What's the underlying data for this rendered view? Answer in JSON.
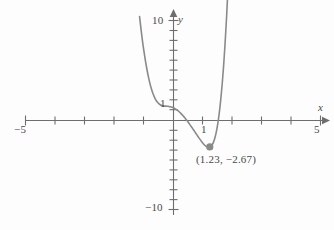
{
  "chart_data": {
    "type": "line",
    "title": "",
    "xlabel": "x",
    "ylabel": "y",
    "xlim": [
      -5,
      5
    ],
    "ylim": [
      -10,
      10
    ],
    "grid": false,
    "legend": null,
    "x_ticks": [
      -5,
      -4,
      -3,
      -2,
      -1,
      0,
      1,
      2,
      3,
      4,
      5
    ],
    "y_ticks": [
      -10,
      -9,
      -8,
      -7,
      -6,
      -5,
      -4,
      -3,
      -2,
      -1,
      0,
      1,
      2,
      3,
      4,
      5,
      6,
      7,
      8,
      9,
      10
    ],
    "x_tick_labels_shown": [
      "-5",
      "1",
      "5"
    ],
    "y_tick_labels_shown": [
      "10",
      "1",
      "-10"
    ],
    "series": [
      {
        "name": "curve",
        "color": "#8a8a8a",
        "x": [
          -1.15,
          -1.1,
          -1.05,
          -1.0,
          -0.95,
          -0.9,
          -0.85,
          -0.8,
          -0.75,
          -0.7,
          -0.65,
          -0.6,
          -0.55,
          -0.5,
          -0.45,
          -0.4,
          -0.35,
          -0.3,
          -0.25,
          -0.2,
          -0.15,
          -0.1,
          -0.05,
          0.0,
          0.05,
          0.1,
          0.15,
          0.2,
          0.25,
          0.3,
          0.35,
          0.4,
          0.45,
          0.5,
          0.55,
          0.6,
          0.65,
          0.7,
          0.75,
          0.8,
          0.85,
          0.9,
          0.95,
          1.0,
          1.05,
          1.1,
          1.15,
          1.2,
          1.23,
          1.25,
          1.3,
          1.35,
          1.4,
          1.45,
          1.5,
          1.55,
          1.6,
          1.65,
          1.7,
          1.75,
          1.8,
          1.85
        ],
        "y": [
          10.5,
          9.2,
          8.0,
          6.95,
          6.0,
          5.15,
          4.4,
          3.75,
          3.2,
          2.75,
          2.38,
          2.08,
          1.86,
          1.7,
          1.59,
          1.52,
          1.48,
          1.46,
          1.45,
          1.44,
          1.42,
          1.39,
          1.34,
          1.28,
          1.2,
          1.1,
          0.99,
          0.86,
          0.72,
          0.56,
          0.39,
          0.21,
          0.02,
          -0.18,
          -0.39,
          -0.6,
          -0.82,
          -1.04,
          -1.26,
          -1.48,
          -1.7,
          -1.91,
          -2.11,
          -2.3,
          -2.47,
          -2.6,
          -2.66,
          -2.67,
          -2.67,
          -2.64,
          -2.5,
          -2.23,
          -1.8,
          -1.18,
          -0.35,
          0.72,
          2.05,
          3.66,
          5.58,
          7.85,
          10.5,
          13.6
        ]
      }
    ],
    "annotations": [
      {
        "name": "minimum-point",
        "label": "(1.23, −2.67)",
        "x": 1.23,
        "y": -2.67,
        "marker": "filled-circle",
        "marker_color": "#8a8a8a"
      }
    ]
  },
  "axes": {
    "x_axis_label": "x",
    "y_axis_label": "y",
    "x_min_label": "−5",
    "x_max_label": "5",
    "x_one_label": "1",
    "y_max_label": "10",
    "y_min_label": "−10",
    "y_one_label": "1"
  },
  "annotation": {
    "minimum_text": "(1.23, −2.67)"
  },
  "colors": {
    "curve": "#8a8a8a",
    "axis": "#6e6e6e",
    "text": "#4a4a4a",
    "background": "#fdfdfd"
  }
}
